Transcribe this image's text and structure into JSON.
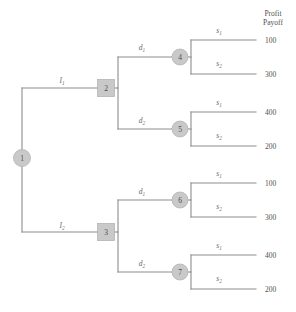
{
  "diagram": {
    "title_lines": [
      "Profit",
      "Payoff"
    ],
    "nodes": [
      {
        "id": "1",
        "label": "1",
        "shape": "circle",
        "x": 22,
        "y": 158,
        "r": 8.5
      },
      {
        "id": "2",
        "label": "2",
        "shape": "square",
        "x": 106,
        "y": 88,
        "size": 17
      },
      {
        "id": "3",
        "label": "3",
        "shape": "square",
        "x": 106,
        "y": 232,
        "size": 17
      },
      {
        "id": "4",
        "label": "4",
        "shape": "circle",
        "x": 180,
        "y": 57,
        "r": 8
      },
      {
        "id": "5",
        "label": "5",
        "shape": "circle",
        "x": 180,
        "y": 129,
        "r": 8
      },
      {
        "id": "6",
        "label": "6",
        "shape": "circle",
        "x": 180,
        "y": 200,
        "r": 8
      },
      {
        "id": "7",
        "label": "7",
        "shape": "circle",
        "x": 180,
        "y": 272,
        "r": 8
      }
    ],
    "branch_labels": [
      {
        "name": "branch-label-i1",
        "base": "I",
        "sub": "1",
        "x": 62,
        "y": 83
      },
      {
        "name": "branch-label-i2",
        "base": "I",
        "sub": "2",
        "x": 62,
        "y": 228
      },
      {
        "name": "branch-label-d1-node2",
        "base": "d",
        "sub": "1",
        "x": 142,
        "y": 50
      },
      {
        "name": "branch-label-d2-node2",
        "base": "d",
        "sub": "2",
        "x": 142,
        "y": 123
      },
      {
        "name": "branch-label-d1-node3",
        "base": "d",
        "sub": "1",
        "x": 142,
        "y": 194
      },
      {
        "name": "branch-label-d2-node3",
        "base": "d",
        "sub": "2",
        "x": 142,
        "y": 266
      },
      {
        "name": "branch-label-s1-node4",
        "base": "s",
        "sub": "1",
        "x": 219,
        "y": 33
      },
      {
        "name": "branch-label-s2-node4",
        "base": "s",
        "sub": "2",
        "x": 219,
        "y": 66
      },
      {
        "name": "branch-label-s1-node5",
        "base": "s",
        "sub": "1",
        "x": 219,
        "y": 105
      },
      {
        "name": "branch-label-s2-node5",
        "base": "s",
        "sub": "2",
        "x": 219,
        "y": 138
      },
      {
        "name": "branch-label-s1-node6",
        "base": "s",
        "sub": "1",
        "x": 219,
        "y": 176
      },
      {
        "name": "branch-label-s2-node6",
        "base": "s",
        "sub": "2",
        "x": 219,
        "y": 209
      },
      {
        "name": "branch-label-s1-node7",
        "base": "s",
        "sub": "1",
        "x": 219,
        "y": 248
      },
      {
        "name": "branch-label-s2-node7",
        "base": "s",
        "sub": "2",
        "x": 219,
        "y": 281
      }
    ],
    "payoffs": [
      {
        "name": "payoff-value-1",
        "value": "100",
        "x": 265,
        "y": 43
      },
      {
        "name": "payoff-value-2",
        "value": "300",
        "x": 265,
        "y": 76
      },
      {
        "name": "payoff-value-3",
        "value": "400",
        "x": 265,
        "y": 115
      },
      {
        "name": "payoff-value-4",
        "value": "200",
        "x": 265,
        "y": 148
      },
      {
        "name": "payoff-value-5",
        "value": "100",
        "x": 265,
        "y": 186
      },
      {
        "name": "payoff-value-6",
        "value": "300",
        "x": 265,
        "y": 219
      },
      {
        "name": "payoff-value-7",
        "value": "400",
        "x": 265,
        "y": 258
      },
      {
        "name": "payoff-value-8",
        "value": "200",
        "x": 265,
        "y": 291
      }
    ],
    "colors": {
      "line": "#8d8d8d",
      "node_fill": "#c9c9c9",
      "text": "#4f4f4f",
      "background": "#ffffff"
    }
  }
}
